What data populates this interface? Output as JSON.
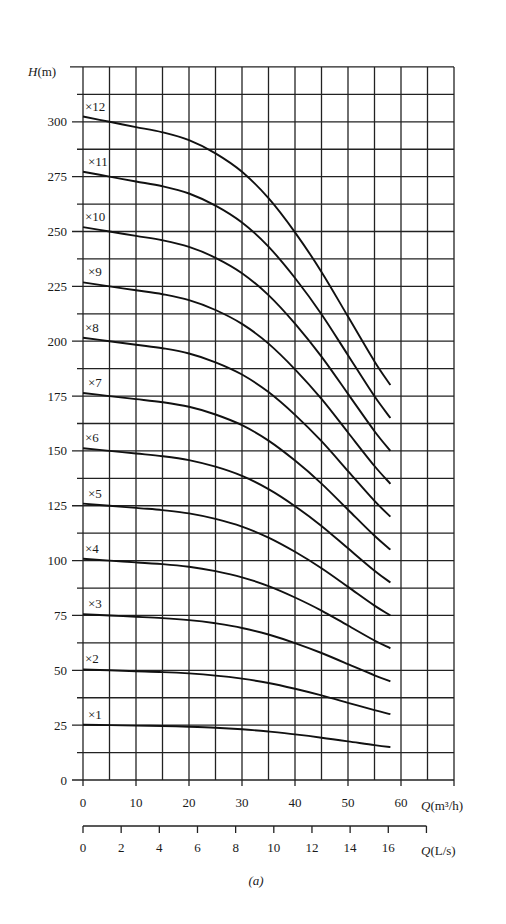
{
  "chart_data": {
    "type": "line",
    "title": "",
    "caption": "(a)",
    "ylabel": "H(m)",
    "ylabel_italic_part": "H",
    "ylabel_unit": "(m)",
    "xlabel": "Q(m³/h)",
    "xlabel_italic_part": "Q",
    "xlabel_unit": "(m³/h)",
    "x2label": "Q(L/s)",
    "x2label_italic_part": "Q",
    "x2label_unit": "(L/s)",
    "xlim": [
      0,
      70
    ],
    "ylim": [
      0,
      325
    ],
    "x2lim": [
      0,
      18
    ],
    "grid": true,
    "grid_x_step": 5,
    "grid_y_step": 12.5,
    "x_ticks": [
      0,
      10,
      20,
      30,
      40,
      50,
      60
    ],
    "y_ticks": [
      0,
      25,
      50,
      75,
      100,
      125,
      150,
      175,
      200,
      225,
      250,
      275,
      300
    ],
    "x2_ticks": [
      0,
      2,
      4,
      6,
      8,
      10,
      12,
      14,
      16
    ],
    "x2_end_tick": 18,
    "legend": "none (curves labeled inline)",
    "x": [
      0,
      5,
      10,
      15,
      20,
      25,
      30,
      35,
      40,
      45,
      50,
      55,
      58
    ],
    "series": [
      {
        "name": "×1",
        "values": [
          25.2,
          25.0,
          24.8,
          24.6,
          24.3,
          23.8,
          23.1,
          22.1,
          20.8,
          19.3,
          17.6,
          15.9,
          15.0
        ]
      },
      {
        "name": "×2",
        "values": [
          50.4,
          50.0,
          49.6,
          49.2,
          48.6,
          47.6,
          46.2,
          44.2,
          41.6,
          38.6,
          35.2,
          31.8,
          30.0
        ]
      },
      {
        "name": "×3",
        "values": [
          75.6,
          75.0,
          74.4,
          73.8,
          72.9,
          71.4,
          69.3,
          66.3,
          62.4,
          57.9,
          52.8,
          47.7,
          45.0
        ]
      },
      {
        "name": "×4",
        "values": [
          100.8,
          100.0,
          99.2,
          98.4,
          97.2,
          95.2,
          92.4,
          88.4,
          83.2,
          77.2,
          70.4,
          63.6,
          60.0
        ]
      },
      {
        "name": "×5",
        "values": [
          126.0,
          125.0,
          124.0,
          123.0,
          121.5,
          119.0,
          115.5,
          110.5,
          104.0,
          96.5,
          88.0,
          79.5,
          75.0
        ]
      },
      {
        "name": "×6",
        "values": [
          151.2,
          150.0,
          148.8,
          147.6,
          145.8,
          142.8,
          138.6,
          132.6,
          124.8,
          115.8,
          105.6,
          95.4,
          90.0
        ]
      },
      {
        "name": "×7",
        "values": [
          176.4,
          175.0,
          173.6,
          172.2,
          170.1,
          166.6,
          161.7,
          154.7,
          145.6,
          135.1,
          123.2,
          111.3,
          105.0
        ]
      },
      {
        "name": "×8",
        "values": [
          201.6,
          200.0,
          198.4,
          196.8,
          194.4,
          190.4,
          184.8,
          176.8,
          166.4,
          154.4,
          140.8,
          127.2,
          120.0
        ]
      },
      {
        "name": "×9",
        "values": [
          226.8,
          225.0,
          223.2,
          221.4,
          218.7,
          214.2,
          207.9,
          198.9,
          187.2,
          173.7,
          158.4,
          143.1,
          135.0
        ]
      },
      {
        "name": "×10",
        "values": [
          252.0,
          250.0,
          248.0,
          246.0,
          243.0,
          238.0,
          231.0,
          221.0,
          208.0,
          193.0,
          176.0,
          159.0,
          150.0
        ]
      },
      {
        "name": "×11",
        "values": [
          277.2,
          275.0,
          272.8,
          270.6,
          267.3,
          261.8,
          254.1,
          243.1,
          228.8,
          212.3,
          193.6,
          174.9,
          165.0
        ]
      },
      {
        "name": "×12",
        "values": [
          302.4,
          300.0,
          297.6,
          295.2,
          291.6,
          285.6,
          277.2,
          265.2,
          249.6,
          231.6,
          211.2,
          190.8,
          180.0
        ]
      }
    ],
    "colors": {
      "line": "#111111",
      "grid": "#222222",
      "text": "#1a1a1a",
      "background": "#ffffff"
    }
  }
}
